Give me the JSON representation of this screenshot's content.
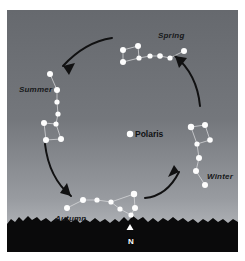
{
  "figure": {
    "kind": "astronomy-diagram",
    "frame": {
      "width": 245,
      "height": 261,
      "margin_color": "#ffffff"
    },
    "scene": {
      "x": 7,
      "y": 10,
      "width": 231,
      "height": 242
    }
  },
  "sky": {
    "gradient_top_color": "#696c70",
    "gradient_mid_color": "#7a7d81",
    "gradient_bottom_color": "#b9bcc0",
    "horizon_y": 206
  },
  "ground": {
    "name": "treeline-silhouette",
    "color": "#0b0b0c",
    "top_y": 206
  },
  "center_star": {
    "name": "Polaris",
    "label": "Polaris",
    "label_x": 128,
    "label_y": 120,
    "star_x": 123,
    "star_y": 124,
    "radius": 3.2,
    "color": "#ffffff"
  },
  "compass": {
    "label": "N",
    "label_x": 121,
    "label_y": 228,
    "marker": "triangle-up",
    "marker_x": 123,
    "marker_y": 218,
    "color": "#ffffff"
  },
  "star_color": "#fdfdfd",
  "link_color": "#d8d9db",
  "arrow_color": "#111112",
  "seasons": [
    {
      "id": "spring",
      "label": "Spring",
      "label_x": 151,
      "label_y": 22,
      "stars": [
        {
          "x": 116,
          "y": 40,
          "r": 3.0
        },
        {
          "x": 116,
          "y": 52,
          "r": 3.0
        },
        {
          "x": 131,
          "y": 36,
          "r": 3.0
        },
        {
          "x": 132,
          "y": 48,
          "r": 2.6
        },
        {
          "x": 143,
          "y": 46,
          "r": 2.6
        },
        {
          "x": 153,
          "y": 46,
          "r": 2.8
        },
        {
          "x": 163,
          "y": 48,
          "r": 2.6
        },
        {
          "x": 177,
          "y": 41,
          "r": 3.0
        }
      ],
      "links": [
        [
          0,
          1
        ],
        [
          0,
          2
        ],
        [
          2,
          3
        ],
        [
          1,
          3
        ],
        [
          3,
          4
        ],
        [
          4,
          5
        ],
        [
          5,
          6
        ],
        [
          6,
          7
        ]
      ]
    },
    {
      "id": "summer",
      "label": "Summer",
      "label_x": 12,
      "label_y": 76,
      "stars": [
        {
          "x": 43,
          "y": 64,
          "r": 3.0
        },
        {
          "x": 50,
          "y": 80,
          "r": 3.0
        },
        {
          "x": 50,
          "y": 92,
          "r": 2.6
        },
        {
          "x": 51,
          "y": 104,
          "r": 2.6
        },
        {
          "x": 49,
          "y": 114,
          "r": 2.6
        },
        {
          "x": 37,
          "y": 113,
          "r": 3.0
        },
        {
          "x": 39,
          "y": 130,
          "r": 3.0
        },
        {
          "x": 54,
          "y": 129,
          "r": 3.0
        }
      ],
      "links": [
        [
          0,
          1
        ],
        [
          1,
          2
        ],
        [
          2,
          3
        ],
        [
          3,
          4
        ],
        [
          4,
          5
        ],
        [
          5,
          6
        ],
        [
          6,
          7
        ],
        [
          7,
          4
        ]
      ]
    },
    {
      "id": "autumn",
      "label": "Autumn",
      "label_x": 48,
      "label_y": 205,
      "stars": [
        {
          "x": 60,
          "y": 198,
          "r": 3.0
        },
        {
          "x": 76,
          "y": 190,
          "r": 3.0
        },
        {
          "x": 90,
          "y": 190,
          "r": 2.6
        },
        {
          "x": 104,
          "y": 192,
          "r": 2.6
        },
        {
          "x": 113,
          "y": 199,
          "r": 2.6
        },
        {
          "x": 124,
          "y": 205,
          "r": 2.6
        },
        {
          "x": 127,
          "y": 184,
          "r": 3.2
        },
        {
          "x": 128,
          "y": 198,
          "r": 3.0
        }
      ],
      "links": [
        [
          0,
          1
        ],
        [
          1,
          2
        ],
        [
          2,
          3
        ],
        [
          3,
          4
        ],
        [
          4,
          5
        ],
        [
          5,
          7
        ],
        [
          7,
          6
        ],
        [
          6,
          3
        ]
      ]
    },
    {
      "id": "winter",
      "label": "Winter",
      "label_x": 200,
      "label_y": 163,
      "stars": [
        {
          "x": 184,
          "y": 117,
          "r": 3.2
        },
        {
          "x": 198,
          "y": 115,
          "r": 3.0
        },
        {
          "x": 203,
          "y": 130,
          "r": 2.8
        },
        {
          "x": 190,
          "y": 134,
          "r": 2.6
        },
        {
          "x": 192,
          "y": 148,
          "r": 3.0
        },
        {
          "x": 189,
          "y": 161,
          "r": 3.0
        },
        {
          "x": 198,
          "y": 175,
          "r": 3.0
        }
      ],
      "links": [
        [
          0,
          1
        ],
        [
          1,
          2
        ],
        [
          2,
          3
        ],
        [
          3,
          0
        ],
        [
          3,
          4
        ],
        [
          4,
          5
        ],
        [
          5,
          6
        ]
      ]
    }
  ],
  "arrows": [
    {
      "id": "arrow-spring-to-summer",
      "direction": "counterclockwise",
      "path": "M 105 28 Q 78 32 56 56",
      "head": [
        [
          56,
          56
        ],
        [
          68,
          53
        ],
        [
          62,
          65
        ]
      ]
    },
    {
      "id": "arrow-summer-to-autumn",
      "direction": "counterclockwise",
      "path": "M 38 134 Q 42 168 64 186",
      "head": [
        [
          64,
          186
        ],
        [
          53,
          183
        ],
        [
          60,
          173
        ]
      ]
    },
    {
      "id": "arrow-autumn-to-winter",
      "direction": "counterclockwise",
      "path": "M 138 188 Q 160 186 172 162",
      "head": [
        [
          172,
          162
        ],
        [
          161,
          167
        ],
        [
          167,
          155
        ]
      ]
    },
    {
      "id": "arrow-winter-to-spring",
      "direction": "counterclockwise",
      "path": "M 193 96 Q 190 64 168 46",
      "head": [
        [
          168,
          46
        ],
        [
          180,
          48
        ],
        [
          172,
          58
        ]
      ]
    }
  ]
}
